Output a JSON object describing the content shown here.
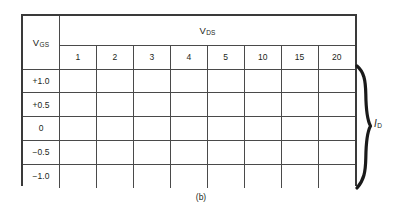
{
  "figure": {
    "caption": "(b)",
    "row_header_label": {
      "base": "V",
      "sub": "GS"
    },
    "column_group_label": {
      "base": "V",
      "sub": "DS"
    },
    "bracket_label": {
      "base": "I",
      "sub": "D"
    },
    "column_headers": [
      "1",
      "2",
      "3",
      "4",
      "5",
      "10",
      "15",
      "20"
    ],
    "row_headers": [
      "+1.0",
      "+0.5",
      "0",
      "−0.5",
      "−1.0"
    ],
    "cell_values": [
      [
        "",
        "",
        "",
        "",
        "",
        "",
        "",
        ""
      ],
      [
        "",
        "",
        "",
        "",
        "",
        "",
        "",
        ""
      ],
      [
        "",
        "",
        "",
        "",
        "",
        "",
        "",
        ""
      ],
      [
        "",
        "",
        "",
        "",
        "",
        "",
        "",
        ""
      ],
      [
        "",
        "",
        "",
        "",
        "",
        "",
        "",
        ""
      ]
    ],
    "colors": {
      "background": "#ffffff",
      "grid_line": "#4a4a4a",
      "frame_line": "#3a3a3a",
      "text": "#231f20",
      "brace": "#1a1a1a"
    }
  }
}
